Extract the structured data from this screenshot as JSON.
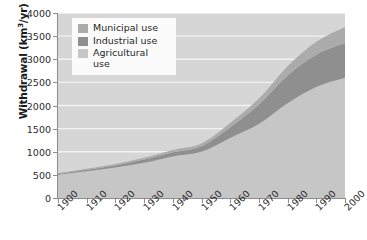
{
  "chart_data": {
    "type": "area",
    "stacked": true,
    "title": "",
    "xlabel": "",
    "ylabel": "Withdrawal (km3/yr)",
    "ylabel_display": "Withdrawal (km³/yr)",
    "ylim": [
      0,
      4000
    ],
    "xlim": [
      1900,
      2000
    ],
    "ytick_labels": [
      "0",
      "500",
      "1000",
      "1500",
      "2000",
      "2500",
      "3000",
      "3500",
      "4000"
    ],
    "ytick_values": [
      0,
      500,
      1000,
      1500,
      2000,
      2500,
      3000,
      3500,
      4000
    ],
    "grid": true,
    "grid_color": "#f2f2f2",
    "plot_background": "#d6d6d6",
    "legend_position": "top-left",
    "categories": [
      1900,
      1910,
      1920,
      1930,
      1940,
      1950,
      1960,
      1970,
      1980,
      1990,
      2000
    ],
    "x": [
      1900,
      1910,
      1920,
      1930,
      1940,
      1950,
      1960,
      1970,
      1980,
      1990,
      2000
    ],
    "series": [
      {
        "name": "Agricultural use",
        "color": "#c6c6c6",
        "values": [
          500,
          580,
          660,
          760,
          900,
          1000,
          1300,
          1600,
          2050,
          2400,
          2600
        ]
      },
      {
        "name": "Industrial use",
        "color": "#8f8f8f",
        "values": [
          20,
          30,
          45,
          70,
          90,
          120,
          230,
          420,
          600,
          700,
          750
        ]
      },
      {
        "name": "Municipal use",
        "color": "#ababab",
        "values": [
          20,
          25,
          30,
          40,
          50,
          60,
          90,
          130,
          200,
          280,
          350
        ]
      }
    ],
    "totals": [
      540,
      635,
      735,
      870,
      1040,
      1180,
      1620,
      2150,
      2850,
      3380,
      3700
    ]
  },
  "legend": {
    "entries": [
      {
        "label": "Municipal use",
        "color": "#ababab"
      },
      {
        "label": "Industrial use",
        "color": "#8f8f8f"
      },
      {
        "label": "Agricultural\nuse",
        "color": "#c6c6c6"
      }
    ]
  },
  "axes": {
    "y_title": "Withdrawal (km",
    "y_title_sup": "3",
    "y_title_tail": "/yr)",
    "x_tick_labels": [
      "1900",
      "1910",
      "1920",
      "1930",
      "1940",
      "1950",
      "1960",
      "1970",
      "1980",
      "1990",
      "2000"
    ],
    "y_tick_labels": [
      "4000",
      "3500",
      "3000",
      "2500",
      "2000",
      "1500",
      "1000",
      "500",
      "0"
    ]
  }
}
